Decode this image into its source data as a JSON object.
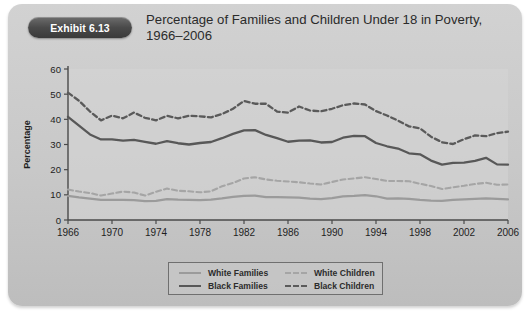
{
  "exhibit": {
    "badge_label": "Exhibit 6.13",
    "title": "Percentage of Families and Children Under 18 in Poverty, 1966–2006"
  },
  "chart_data": {
    "type": "line",
    "title": "Percentage of Families and Children Under 18 in Poverty, 1966–2006",
    "xlabel": "",
    "ylabel": "Percentage",
    "ylim": [
      0,
      60
    ],
    "ytick_step": 10,
    "yticks": [
      0,
      10,
      20,
      30,
      40,
      50,
      60
    ],
    "xlim": [
      1966,
      2006
    ],
    "xticks": [
      1966,
      1970,
      1974,
      1978,
      1982,
      1986,
      1990,
      1994,
      1998,
      2002,
      2006
    ],
    "xtick_labels": [
      "1966",
      "1970",
      "1974",
      "1978",
      "1982",
      "1986",
      "1990",
      "1994",
      "1998",
      "2002",
      "2006"
    ],
    "grid": false,
    "legend_position": "bottom",
    "x": [
      1966,
      1967,
      1968,
      1969,
      1970,
      1971,
      1972,
      1973,
      1974,
      1975,
      1976,
      1977,
      1978,
      1979,
      1980,
      1981,
      1982,
      1983,
      1984,
      1985,
      1986,
      1987,
      1988,
      1989,
      1990,
      1991,
      1992,
      1993,
      1994,
      1995,
      1996,
      1997,
      1998,
      1999,
      2000,
      2001,
      2002,
      2003,
      2004,
      2005,
      2006
    ],
    "series": [
      {
        "name": "White Families",
        "style": "solid",
        "color": "#9b9b9b",
        "values": [
          9.6,
          9.0,
          8.5,
          8.0,
          8.0,
          8.0,
          7.9,
          7.5,
          7.6,
          8.3,
          8.1,
          8.0,
          7.9,
          8.1,
          8.6,
          9.2,
          9.6,
          9.7,
          9.1,
          9.1,
          9.0,
          8.9,
          8.5,
          8.3,
          8.7,
          9.4,
          9.6,
          9.9,
          9.4,
          8.5,
          8.6,
          8.4,
          8.0,
          7.7,
          7.6,
          8.0,
          8.2,
          8.4,
          8.6,
          8.4,
          8.2
        ]
      },
      {
        "name": "Black Families",
        "style": "solid",
        "color": "#585858",
        "values": [
          41.0,
          37.5,
          34.0,
          32.0,
          32.0,
          31.5,
          31.8,
          31.0,
          30.3,
          31.3,
          30.5,
          30.0,
          30.6,
          31.0,
          32.5,
          34.2,
          35.6,
          35.7,
          33.8,
          32.5,
          31.1,
          31.5,
          31.6,
          30.8,
          31.0,
          32.7,
          33.4,
          33.3,
          30.6,
          29.3,
          28.4,
          26.5,
          26.1,
          23.6,
          22.0,
          22.7,
          22.8,
          23.5,
          24.7,
          22.1,
          22.0
        ]
      },
      {
        "name": "White Children",
        "style": "dashed",
        "color": "#a5a5a5",
        "values": [
          12.1,
          11.3,
          10.7,
          9.7,
          10.5,
          11.3,
          10.9,
          9.7,
          11.2,
          12.5,
          11.6,
          11.4,
          11.0,
          11.4,
          13.4,
          14.7,
          16.5,
          17.0,
          16.1,
          15.6,
          15.3,
          15.0,
          14.5,
          14.1,
          15.1,
          16.1,
          16.5,
          17.0,
          16.3,
          15.5,
          15.5,
          15.4,
          14.4,
          13.5,
          12.3,
          13.0,
          13.6,
          14.3,
          14.8,
          14.0,
          14.1
        ]
      },
      {
        "name": "Black Children",
        "style": "dashed",
        "color": "#5a5a5a",
        "values": [
          50.6,
          47.4,
          43.1,
          39.6,
          41.5,
          40.4,
          42.7,
          40.6,
          39.6,
          41.4,
          40.4,
          41.4,
          41.2,
          40.8,
          42.1,
          44.2,
          47.3,
          46.2,
          46.2,
          43.1,
          42.7,
          45.1,
          43.5,
          43.2,
          44.2,
          45.6,
          46.3,
          45.9,
          43.3,
          41.5,
          39.5,
          37.2,
          36.4,
          33.1,
          30.9,
          30.2,
          32.1,
          33.6,
          33.3,
          34.5,
          35.1
        ]
      }
    ]
  },
  "legend": {
    "items": [
      {
        "label": "White Families"
      },
      {
        "label": "White Children"
      },
      {
        "label": "Black Families"
      },
      {
        "label": "Black Children"
      }
    ]
  }
}
